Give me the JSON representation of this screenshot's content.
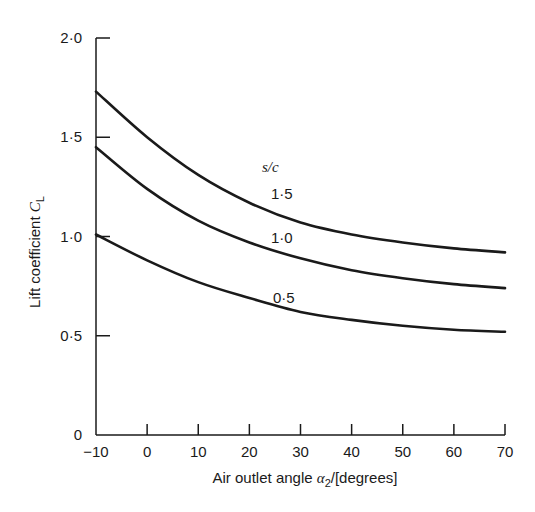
{
  "chart_data": {
    "type": "line",
    "title": "",
    "xlabel": "Air outlet angle α2/[degrees]",
    "ylabel": "Lift coefficient CL",
    "xlim": [
      -10,
      70
    ],
    "ylim": [
      0,
      2.0
    ],
    "x_ticks": [
      "-10",
      "0",
      "10",
      "20",
      "30",
      "40",
      "50",
      "60",
      "70"
    ],
    "y_ticks": [
      "0",
      "0·5",
      "1·0",
      "1·5",
      "2·0"
    ],
    "grid": false,
    "legend_title": "s/c",
    "x": [
      -10,
      0,
      10,
      20,
      30,
      40,
      50,
      60,
      70
    ],
    "series": [
      {
        "name": "1·5",
        "values": [
          1.73,
          1.5,
          1.31,
          1.17,
          1.07,
          1.01,
          0.97,
          0.94,
          0.92
        ]
      },
      {
        "name": "1·0",
        "values": [
          1.45,
          1.24,
          1.08,
          0.97,
          0.89,
          0.83,
          0.79,
          0.76,
          0.74
        ]
      },
      {
        "name": "0·5",
        "values": [
          1.01,
          0.88,
          0.77,
          0.69,
          0.62,
          0.58,
          0.55,
          0.53,
          0.52
        ]
      }
    ]
  },
  "labels": {
    "y_axis_main": "Lift coefficient ",
    "y_axis_sym": "C",
    "y_axis_sub": "L",
    "x_axis_main": "Air outlet angle ",
    "x_axis_sym": "α",
    "x_axis_sub": "2",
    "x_axis_tail": "/[degrees]",
    "legend_title": "s/c",
    "curve_1": "1·5",
    "curve_2": "1·0",
    "curve_3": "0·5"
  }
}
